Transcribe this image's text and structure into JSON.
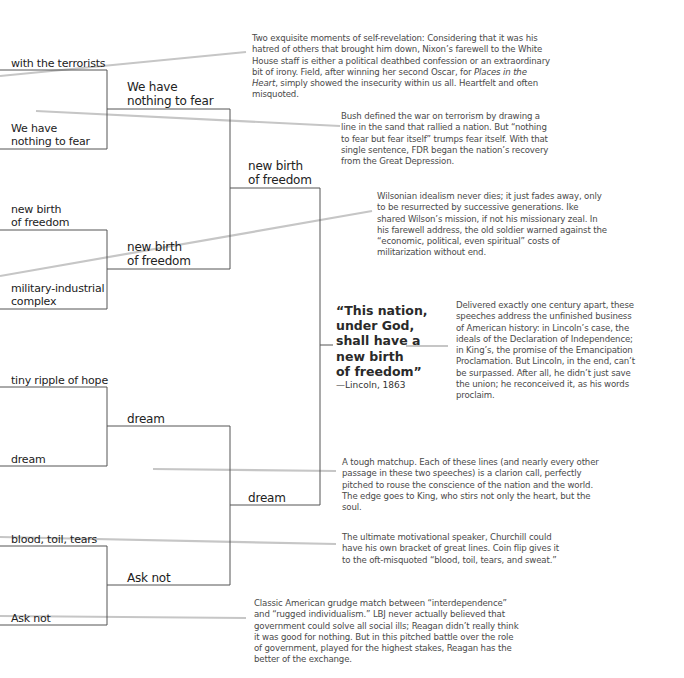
{
  "bracket": {
    "round1": [
      {
        "label": "with the terrorists"
      },
      {
        "label": "We have\nnothing to fear"
      },
      {
        "label": "new birth\nof freedom"
      },
      {
        "label": "military-industrial\ncomplex"
      },
      {
        "label": "tiny ripple of hope"
      },
      {
        "label": "dream"
      },
      {
        "label": "blood, toil, tears"
      },
      {
        "label": "Ask not"
      }
    ],
    "round2": [
      {
        "label": "We have\nnothing to fear"
      },
      {
        "label": "new birth\nof freedom"
      },
      {
        "label": "dream"
      },
      {
        "label": "Ask not"
      }
    ],
    "round3": [
      {
        "label": "new birth\nof freedom"
      },
      {
        "label": "dream"
      }
    ],
    "winner": {
      "quote": "“This nation,\nunder God,\nshall have a\nnew birth\nof freedom”",
      "attribution": "—Lincoln, 1863"
    }
  },
  "notes": [
    {
      "id": "nixon-field",
      "text_before": "Two exquisite moments of self-revelation: Considering that it was his hatred of others that brought him down, Nixon’s farewell to the White House staff is either a political deathbed confession or an extraordinary bit of irony. Field, after winning her second Oscar, for ",
      "italic": "Places in the Heart",
      "text_after": ", simply showed the insecurity within us all. Heartfelt and often misquoted."
    },
    {
      "id": "bush-fdr",
      "text": "Bush defined the war on terrorism by drawing a line in the sand that rallied a nation. But “nothing to fear but fear itself” trumps fear itself. With that single sentence, FDR began the nation’s recovery from the Great Depression."
    },
    {
      "id": "wilson-ike",
      "text": "Wilsonian idealism never dies; it just fades away, only to be resurrected by successive generations. Ike shared Wilson’s mission, if not his missionary zeal. In his farewell address, the old soldier warned against the “economic, political, even spiritual” costs of militarization without end."
    },
    {
      "id": "lincoln-king",
      "text": "Delivered exactly one century apart, these speeches address the unfinished business of American history: in Lincoln’s case, the ideals of the Declaration of Independence; in King’s, the promise of the Emancipation Proclamation. But Lincoln, in the end, can’t be surpassed. After all, he didn’t just save the union; he reconceived it, as his words proclaim."
    },
    {
      "id": "rfk-king",
      "text": "A tough matchup. Each of these lines (and nearly every other passage in these two speeches) is a clarion call, perfectly pitched to rouse the conscience of the nation and the world. The edge goes to King, who stirs not only the heart, but the soul."
    },
    {
      "id": "churchill",
      "text": "The ultimate motivational speaker, Churchill could have his own bracket of great lines. Coin flip gives it to the oft-misquoted “blood, toil, tears, and sweat.”"
    },
    {
      "id": "jfk-reagan",
      "text": "Classic American grudge match between “interdependence” and “rugged individualism.” LBJ never actually believed that government could solve all social ills; Reagan didn’t really think it was good for nothing. But in this pitched battle over the role of government, played for the highest stakes, Reagan has the better of the exchange."
    }
  ],
  "colors": {
    "bracket_line": "#555555",
    "connector_line": "#c4c4c4",
    "note_text": "#4a4a4a"
  }
}
